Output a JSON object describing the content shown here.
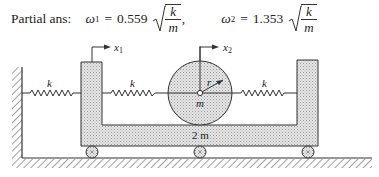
{
  "answer": {
    "label": "Partial ans:",
    "omega1": {
      "symbol": "ω",
      "sub": "1",
      "equals": "=",
      "coefficient": "0.559",
      "sqrt_num": "k",
      "sqrt_den": "m",
      "trailing": ","
    },
    "omega2": {
      "symbol": "ω",
      "sub": "2",
      "equals": "=",
      "coefficient": "1.353",
      "sqrt_num": "k",
      "sqrt_den": "m",
      "trailing": ""
    }
  },
  "diagram": {
    "springs": [
      {
        "label": "k",
        "from": "left-wall",
        "to": "cart-left-pillar"
      },
      {
        "label": "k",
        "from": "cart-left-pillar",
        "to": "disc"
      },
      {
        "label": "k",
        "from": "disc",
        "to": "cart-right-pillar"
      }
    ],
    "coordinates": [
      {
        "symbol": "x",
        "sub": "1"
      },
      {
        "symbol": "x",
        "sub": "2"
      }
    ],
    "disc": {
      "radius_label": "r",
      "mass_label": "m"
    },
    "cart": {
      "mass_label": "2 m"
    },
    "colors": {
      "line": "#333333",
      "fill": "#d9d9d9",
      "background": "#ffffff"
    }
  }
}
